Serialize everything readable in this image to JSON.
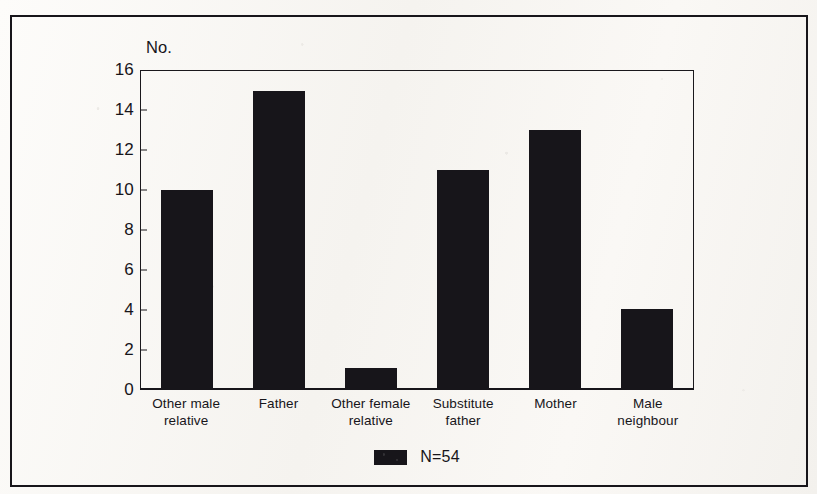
{
  "chart_data": {
    "type": "bar",
    "title": "",
    "xlabel": "",
    "ylabel": "No.",
    "ylim": [
      0,
      16
    ],
    "yticks": [
      0,
      2,
      4,
      6,
      8,
      10,
      12,
      14,
      16
    ],
    "grid": false,
    "legend_position": "bottom-center",
    "legend": [
      "N=54"
    ],
    "bar_color": "#17151a",
    "categories": [
      "Other male relative",
      "Father",
      "Other female relative",
      "Substitute father",
      "Mother",
      "Male neighbour"
    ],
    "values": [
      10,
      15,
      1,
      11,
      13,
      4
    ],
    "total": 54
  },
  "axis": {
    "y_label": "No.",
    "tick_labels": [
      "16",
      "14",
      "12",
      "10",
      "8",
      "6",
      "4",
      "2",
      "0"
    ]
  },
  "legend": {
    "label": "N=54"
  }
}
